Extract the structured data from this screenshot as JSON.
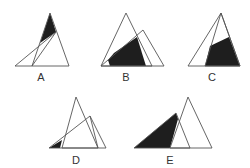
{
  "colors": {
    "shade": "#1e1e1e",
    "stroke": "#555555",
    "label": "#333333",
    "background": "#ffffff"
  },
  "figures": [
    {
      "label": "A",
      "label_pos": [
        41,
        81
      ],
      "triangles": [
        [
          [
            50,
            13
          ],
          [
            32,
            66
          ],
          [
            69,
            66
          ]
        ],
        [
          [
            56,
            32
          ],
          [
            15,
            66
          ],
          [
            32,
            66
          ]
        ]
      ],
      "shaded": [
        [
          50,
          13
        ],
        [
          56,
          32
        ],
        [
          40,
          43
        ]
      ]
    },
    {
      "label": "B",
      "label_pos": [
        126,
        81
      ],
      "triangles": [
        [
          [
            126,
            13
          ],
          [
            101,
            66
          ],
          [
            152,
            66
          ]
        ],
        [
          [
            143,
            30
          ],
          [
            101,
            66
          ],
          [
            164,
            66
          ]
        ]
      ],
      "shaded": [
        [
          110,
          66
        ],
        [
          146,
          66
        ],
        [
          137,
          37
        ],
        [
          114,
          53
        ],
        [
          108,
          60
        ]
      ]
    },
    {
      "label": "C",
      "label_pos": [
        212,
        81
      ],
      "triangles": [
        [
          [
            221,
            13
          ],
          [
            188,
            66
          ],
          [
            240,
            66
          ]
        ],
        [
          [
            221,
            13
          ],
          [
            205,
            66
          ],
          [
            240,
            66
          ]
        ]
      ],
      "shaded": [
        [
          205,
          66
        ],
        [
          240,
          66
        ],
        [
          229,
          37
        ],
        [
          210,
          46
        ]
      ]
    },
    {
      "label": "D",
      "label_pos": [
        76,
        164
      ],
      "triangles": [
        [
          [
            76,
            97
          ],
          [
            62,
            148
          ],
          [
            98,
            148
          ]
        ],
        [
          [
            90,
            116
          ],
          [
            49,
            148
          ],
          [
            106,
            148
          ]
        ],
        [
          [
            90,
            116
          ],
          [
            98,
            148
          ]
        ]
      ],
      "shaded": [
        [
          49,
          148
        ],
        [
          60,
          148
        ],
        [
          62,
          140
        ]
      ]
    },
    {
      "label": "E",
      "label_pos": [
        170,
        164
      ],
      "triangles": [
        [
          [
            176,
            113
          ],
          [
            134,
            148
          ],
          [
            190,
            148
          ]
        ],
        [
          [
            188,
            97
          ],
          [
            170,
            148
          ],
          [
            212,
            148
          ]
        ]
      ],
      "shaded": [
        [
          134,
          148
        ],
        [
          170,
          148
        ],
        [
          178,
          119
        ],
        [
          176,
          113
        ]
      ]
    }
  ]
}
